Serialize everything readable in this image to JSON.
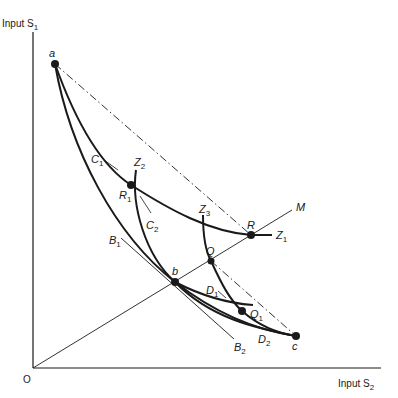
{
  "diagram": {
    "type": "isoquant-diagram",
    "axes": {
      "y_label": "Input S",
      "y_label_sub": "1",
      "x_label": "Input S",
      "x_label_sub": "2",
      "origin_label": "O"
    },
    "points": [
      {
        "id": "a",
        "label": "a",
        "sub": "",
        "x": 55,
        "y": 64,
        "lx": 48,
        "ly": 57
      },
      {
        "id": "b",
        "label": "b",
        "sub": "",
        "x": 175,
        "y": 282,
        "lx": 175,
        "ly": 276
      },
      {
        "id": "c",
        "label": "c",
        "sub": "",
        "x": 296,
        "y": 336,
        "lx": 292,
        "ly": 350
      },
      {
        "id": "R",
        "label": "R",
        "sub": "",
        "x": 251,
        "y": 235,
        "lx": 248,
        "ly": 229
      },
      {
        "id": "R1",
        "label": "R",
        "sub": "1",
        "x": 131,
        "y": 185,
        "lx": 120,
        "ly": 199
      },
      {
        "id": "Q",
        "label": "Q",
        "sub": "",
        "x": 211,
        "y": 261,
        "lx": 207,
        "ly": 255
      },
      {
        "id": "Q1",
        "label": "Q",
        "sub": "1",
        "x": 242,
        "y": 311,
        "lx": 250,
        "ly": 318
      }
    ],
    "curve_labels": [
      {
        "id": "C1",
        "label": "C",
        "sub": "1",
        "x": 91,
        "y": 164
      },
      {
        "id": "C2",
        "label": "C",
        "sub": "2",
        "x": 145,
        "y": 230
      },
      {
        "id": "Z1",
        "label": "Z",
        "sub": "1",
        "x": 275,
        "y": 239
      },
      {
        "id": "Z2",
        "label": "Z",
        "sub": "2",
        "x": 134,
        "y": 166
      },
      {
        "id": "Z3",
        "label": "Z",
        "sub": "3",
        "x": 200,
        "y": 214
      },
      {
        "id": "B1",
        "label": "B",
        "sub": "1",
        "x": 109,
        "y": 244
      },
      {
        "id": "B2",
        "label": "B",
        "sub": "2",
        "x": 235,
        "y": 351
      },
      {
        "id": "D1",
        "label": "D",
        "sub": "1",
        "x": 206,
        "y": 294
      },
      {
        "id": "D2",
        "label": "D",
        "sub": "2",
        "x": 258,
        "y": 343
      },
      {
        "id": "M",
        "label": "M",
        "sub": "",
        "x": 296,
        "y": 210
      }
    ]
  },
  "colors": {
    "ink": "#1a1a1a",
    "background": "#ffffff"
  }
}
